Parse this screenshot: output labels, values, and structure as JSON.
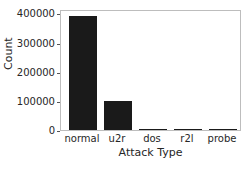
{
  "chart_data": {
    "type": "bar",
    "title": "",
    "xlabel": "Attack Type",
    "ylabel": "Count",
    "categories": [
      "normal",
      "u2r",
      "dos",
      "r2l",
      "probe"
    ],
    "values": [
      390000,
      98000,
      4000,
      1000,
      50
    ],
    "ylim": [
      0,
      415000
    ],
    "yticks": [
      0,
      100000,
      200000,
      300000,
      400000
    ],
    "ytick_labels": [
      "0",
      "100000",
      "200000",
      "300000",
      "400000"
    ],
    "grid": false,
    "legend": null,
    "bar_color": "#1a1a1a"
  }
}
